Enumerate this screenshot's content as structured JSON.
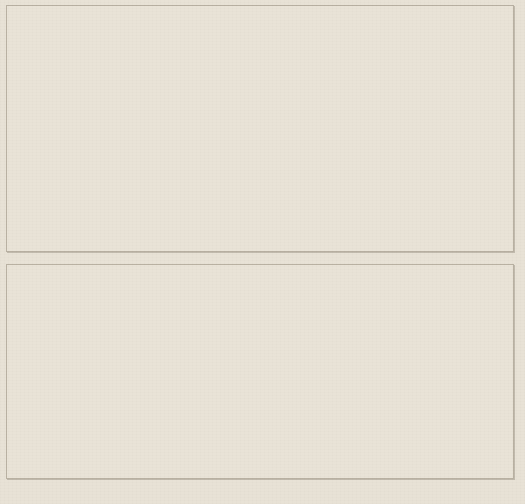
{
  "figure": {
    "background_color": "#e8e2d6",
    "caption": "图3-3 “十三五”期间深圳市GEP与调节服务价值变化情况"
  },
  "chart_data": [
    {
      "type": "bar",
      "panel": "top",
      "title": "",
      "xlabel": "",
      "ylabel": "GEP（亿元）",
      "categories": [
        "2016",
        "2017",
        "2018",
        "2019",
        "2020"
      ],
      "values": [
        1193.23,
        1220.89,
        1256.53,
        1321.26,
        1303.82
      ],
      "data_labels": [
        "1193.23",
        "1220.89",
        "1256.53",
        "1321.26",
        "1303.82"
      ],
      "ylim": [
        0,
        1400
      ],
      "ytick_labels": [
        "1400.00",
        "1200.00",
        "1000.00",
        "800.00",
        "600.00",
        "400.00",
        "200.00",
        "0.00"
      ],
      "ytick_values": [
        1400,
        1200,
        1000,
        800,
        600,
        400,
        200,
        0
      ],
      "bar_color": "#4a6a9e",
      "trendline": true,
      "trendline_style": "dotted",
      "trendline_color": "#33312c",
      "grid": false,
      "legend": "none"
    },
    {
      "type": "bar",
      "panel": "bottom",
      "title": "",
      "xlabel": "",
      "ylabel": "调节服务价值（亿元）",
      "categories": [
        "2016",
        "2017",
        "2018",
        "2019",
        "2020"
      ],
      "values": [
        611.67,
        624.52,
        656.25,
        680.47,
        699.51
      ],
      "data_labels": [
        "611.67",
        "624.52",
        "656.25",
        "680.47",
        "699.51"
      ],
      "ylim": [
        0,
        800
      ],
      "ytick_labels": [
        "800.00",
        "700.00",
        "600.00",
        "500.00",
        "400.00",
        "300.00",
        "200.00",
        "100.00",
        "0.00"
      ],
      "ytick_values": [
        800,
        700,
        600,
        500,
        400,
        300,
        200,
        100,
        0
      ],
      "bar_color": "#74a434",
      "trendline": true,
      "trendline_style": "dotted",
      "trendline_color": "#4e5a33",
      "grid": false,
      "legend": "none"
    }
  ]
}
